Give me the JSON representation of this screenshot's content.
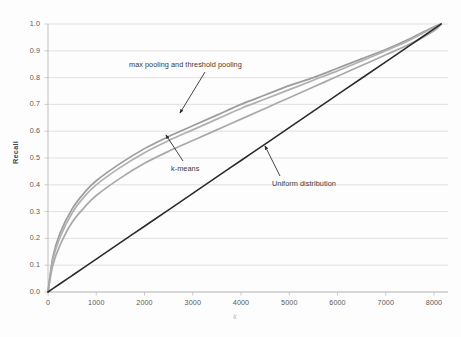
{
  "chart_data": {
    "type": "line",
    "title": "",
    "xlabel": "k",
    "ylabel": "Recall",
    "xlim": [
      0,
      8150
    ],
    "ylim": [
      0,
      1.0
    ],
    "grid": "horizontal",
    "legend_position": "none (inline annotations with arrows)",
    "x_ticks": [
      "0",
      "1000",
      "2000",
      "3000",
      "4000",
      "5000",
      "6000",
      "7000",
      "8000"
    ],
    "x_tick_values": [
      0,
      1000,
      2000,
      3000,
      4000,
      5000,
      6000,
      7000,
      8000
    ],
    "y_ticks": [
      "0.0",
      "0.1",
      "0.2",
      "0.3",
      "0.4",
      "0.5",
      "0.6",
      "0.7",
      "0.8",
      "0.9",
      "1.0"
    ],
    "y_tick_values": [
      0.0,
      0.1,
      0.2,
      0.3,
      0.4,
      0.5,
      0.6,
      0.7,
      0.8,
      0.9,
      1.0
    ],
    "x": [
      0,
      100,
      250,
      500,
      750,
      1000,
      1500,
      2000,
      2500,
      3000,
      3500,
      4000,
      4500,
      5000,
      5500,
      6000,
      6500,
      7000,
      7500,
      8000,
      8150
    ],
    "series": [
      {
        "name": "max pooling and threshold pooling",
        "color": "#9c9c9c",
        "width": 1.7,
        "values": [
          0.0,
          0.13,
          0.22,
          0.31,
          0.37,
          0.415,
          0.48,
          0.535,
          0.58,
          0.62,
          0.66,
          0.7,
          0.735,
          0.77,
          0.8,
          0.835,
          0.87,
          0.905,
          0.945,
          0.99,
          1.0
        ]
      },
      {
        "name": "threshold pooling (second of overlapping pair)",
        "color": "#b0b0b0",
        "width": 1.7,
        "values": [
          0.0,
          0.12,
          0.205,
          0.295,
          0.355,
          0.4,
          0.465,
          0.52,
          0.565,
          0.605,
          0.645,
          0.685,
          0.72,
          0.755,
          0.79,
          0.825,
          0.862,
          0.9,
          0.94,
          0.988,
          1.0
        ]
      },
      {
        "name": "k-means",
        "color": "#a9a9a9",
        "width": 1.7,
        "values": [
          0.0,
          0.1,
          0.175,
          0.26,
          0.315,
          0.36,
          0.425,
          0.48,
          0.525,
          0.565,
          0.605,
          0.645,
          0.685,
          0.725,
          0.765,
          0.805,
          0.845,
          0.885,
          0.925,
          0.975,
          1.0
        ]
      },
      {
        "name": "Uniform distribution",
        "color": "#2b2b2b",
        "width": 1.6,
        "values": [
          0.0,
          0.0123,
          0.0307,
          0.0613,
          0.092,
          0.1227,
          0.184,
          0.2454,
          0.3067,
          0.3681,
          0.4294,
          0.4908,
          0.5521,
          0.6135,
          0.6748,
          0.7362,
          0.7975,
          0.8589,
          0.9202,
          0.9816,
          1.0
        ]
      }
    ],
    "annotations": [
      {
        "name": "max-pooling-and-threshold-pooling",
        "text": "max pooling and threshold pooling",
        "arrow_from": [
          205,
          72
        ],
        "arrow_to": [
          180,
          113
        ]
      },
      {
        "name": "k-means",
        "text": "k-means",
        "arrow_from": [
          183,
          161
        ],
        "arrow_to": [
          166,
          135
        ]
      },
      {
        "name": "uniform-distribution",
        "text": "Uniform distribution",
        "arrow_from": [
          280,
          176
        ],
        "arrow_to": [
          265,
          146
        ]
      }
    ]
  },
  "axes": {
    "y_title": "Recall",
    "x_title": "k"
  },
  "colors": {
    "plot_background": "#fdfdfd",
    "gridline": "#d9d9d9",
    "axis_line": "#bfbfbf",
    "tick_text": "#595959",
    "curve_gray": "#a9a9a9",
    "curve_black": "#2b2b2b"
  }
}
